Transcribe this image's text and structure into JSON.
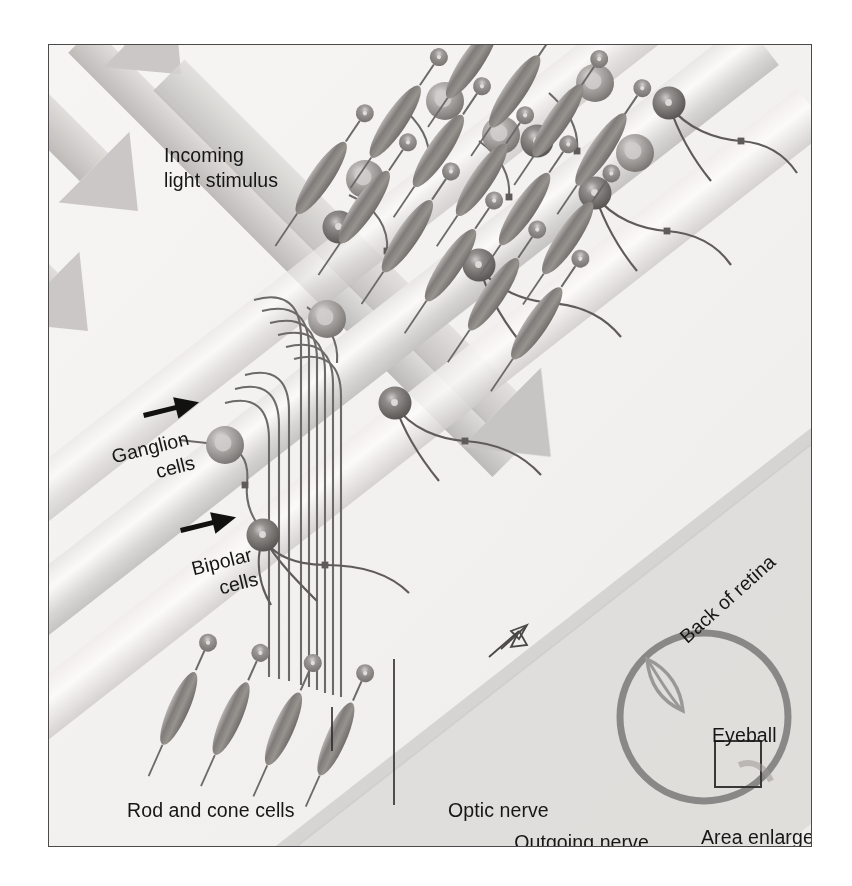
{
  "figure": {
    "border_color": "#4a4a4a",
    "background_color": "#f6f4f2",
    "ink_color": "#161616"
  },
  "labels": {
    "incoming_light": "Incoming\nlight stimulus",
    "ganglion_cells": "Ganglion\ncells",
    "bipolar_cells": "Bipolar\ncells",
    "rod_and_cone_cells": "Rod and cone cells",
    "optic_nerve": "Optic nerve",
    "outgoing_impulse": "Outgoing nerve\nimpulse to cortex",
    "back_of_retina": "Back of retina",
    "eyeball": "Eyeball",
    "area_enlarged": "Area enlarged"
  },
  "diagram": {
    "light_arrows": {
      "count": 3,
      "direction_degrees": 45,
      "color": "#c9c7c5",
      "description": "Three broad shaded arrows entering from upper left pointing down-right"
    },
    "retina_bands": {
      "count": 3,
      "orientation_degrees": -38,
      "color": "#d6d4d2",
      "description": "Diagonal translucent layered bands representing retinal layers"
    },
    "ganglion_cell": {
      "body_color": "#8d8a88",
      "nucleus_color": "#cfcdcb",
      "radius_px": 19
    },
    "bipolar_cell": {
      "body_color": "#6e6b69",
      "nucleus_color": "#d8d6d4",
      "radius_px": 16
    },
    "rod_cone_cell": {
      "body_color": "#8a8785",
      "shape": "spindle",
      "length_px": 86
    },
    "optic_nerve": {
      "fiber_count": 6,
      "color": "#6c6a68",
      "description": "Bundle of parallel ganglion axons curving down to the optic nerve head"
    },
    "impulse_arrow": {
      "color": "#5a5856",
      "direction": "up-right",
      "style": "outlined"
    },
    "eyeball_inset": {
      "circle_color": "#8a8886",
      "lens_color": "#9a9896",
      "box_color": "#3a3836",
      "description": "Small eyeball schematic with lens at upper-left and a square marking the enlarged region"
    }
  }
}
